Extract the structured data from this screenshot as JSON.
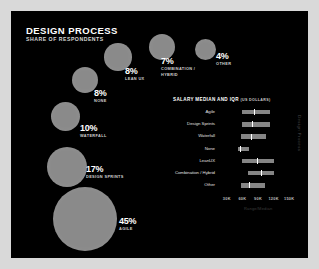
{
  "header": {
    "title": "DESIGN PROCESS",
    "subtitle": "SHARE OF RESPONDENTS"
  },
  "side_label": "Design Process",
  "colors": {
    "background": "#000000",
    "page": "#d9d9d9",
    "bubble": "#8a8a8a",
    "bar": "#858585",
    "median": "#ffffff",
    "text": "#ffffff",
    "muted": "#cfcfcf"
  },
  "chart_data": [
    {
      "type": "bubble",
      "title": "DESIGN PROCESS",
      "subtitle": "SHARE OF RESPONDENTS",
      "xlabel": "",
      "ylabel": "",
      "unit": "%",
      "categories": [
        "Other",
        "Combination / Hybrid",
        "Lean UX",
        "None",
        "Waterfall",
        "Design Sprints",
        "Agile"
      ],
      "values": [
        4,
        7,
        8,
        8,
        10,
        17,
        45
      ],
      "points": [
        {
          "label": "OTHER",
          "value": 4,
          "value_text": "4%",
          "cx": 194,
          "cy": 38,
          "r": 10.5,
          "pct_x": 205,
          "pct_y": 40,
          "lab_x": 205,
          "lab_y": 50
        },
        {
          "label": "COMBINATION /\nHYBRID",
          "value": 7,
          "value_text": "7%",
          "cx": 151,
          "cy": 36,
          "r": 13.0,
          "pct_x": 150,
          "pct_y": 45,
          "lab_x": 150,
          "lab_y": 55
        },
        {
          "label": "LEAN UX",
          "value": 8,
          "value_text": "8%",
          "cx": 107,
          "cy": 46,
          "r": 13.8,
          "pct_x": 114,
          "pct_y": 55,
          "lab_x": 114,
          "lab_y": 65
        },
        {
          "label": "NONE",
          "value": 8,
          "value_text": "8%",
          "cx": 74,
          "cy": 69,
          "r": 13.2,
          "pct_x": 83,
          "pct_y": 77,
          "lab_x": 83,
          "lab_y": 87
        },
        {
          "label": "WATERFALL",
          "value": 10,
          "value_text": "10%",
          "cx": 54,
          "cy": 105,
          "r": 14.5,
          "pct_x": 69,
          "pct_y": 112,
          "lab_x": 69,
          "lab_y": 122
        },
        {
          "label": "DESIGN SPRINTS",
          "value": 17,
          "value_text": "17%",
          "cx": 56,
          "cy": 156,
          "r": 20.0,
          "pct_x": 75,
          "pct_y": 153,
          "lab_x": 75,
          "lab_y": 163
        },
        {
          "label": "AGILE",
          "value": 45,
          "value_text": "45%",
          "cx": 74,
          "cy": 208,
          "r": 32.0,
          "pct_x": 108,
          "pct_y": 205,
          "lab_x": 108,
          "lab_y": 215
        }
      ]
    },
    {
      "type": "bar",
      "chart_kind": "range-with-median",
      "title": "SALARY MEDIAN AND IQR",
      "unit_note": "(US DOLLARS)",
      "xlabel": "",
      "ylabel": "",
      "axis_caption": "Range/Median",
      "xlim": [
        15000,
        165000
      ],
      "ticks": [
        30000,
        60000,
        90000,
        120000,
        150000
      ],
      "tick_labels": [
        "30K",
        "60K",
        "90K",
        "120K",
        "150K"
      ],
      "grid": false,
      "categories": [
        "Agile",
        "Design Sprints",
        "Waterfall",
        "None",
        "LeanUX",
        "Combination / Hybrid",
        "Other"
      ],
      "rows": [
        {
          "label": "Agile",
          "q1": 60000,
          "q3": 113000,
          "median": 83000
        },
        {
          "label": "Design Sprints",
          "q1": 60000,
          "q3": 113000,
          "median": 79000
        },
        {
          "label": "Waterfall",
          "q1": 57000,
          "q3": 105000,
          "median": 77000
        },
        {
          "label": "None",
          "q1": 51000,
          "q3": 73000,
          "median": 56000
        },
        {
          "label": "LeanUX",
          "q1": 60000,
          "q3": 121000,
          "median": 88000
        },
        {
          "label": "Combination / Hybrid",
          "q1": 70000,
          "q3": 121000,
          "median": 95000
        },
        {
          "label": "Other",
          "q1": 57000,
          "q3": 104000,
          "median": 73000
        }
      ]
    }
  ]
}
